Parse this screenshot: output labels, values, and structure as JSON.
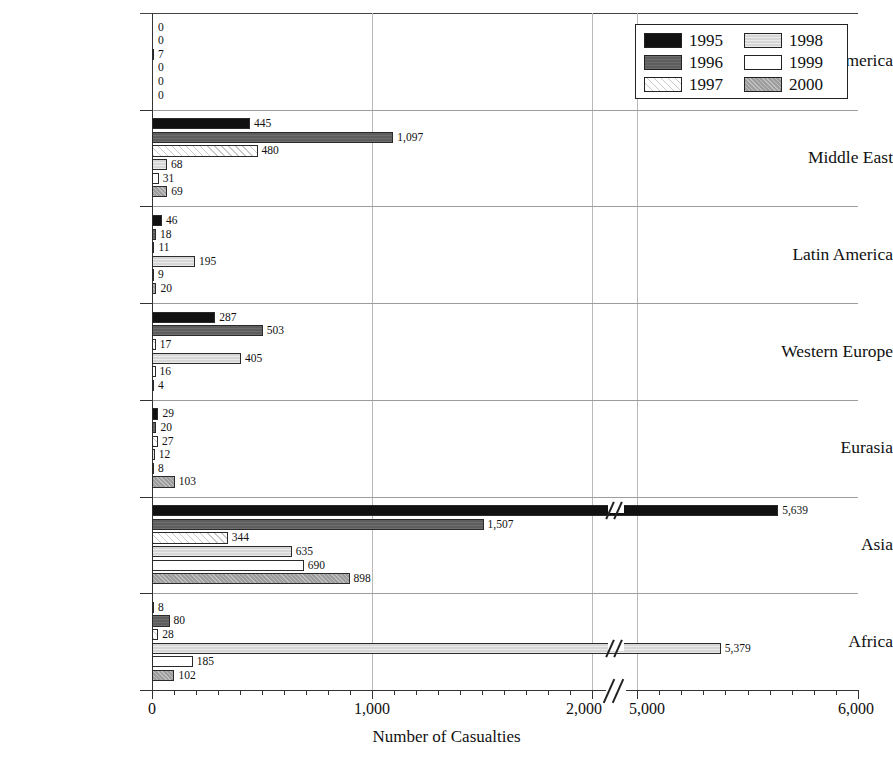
{
  "chart_data": {
    "type": "bar",
    "orientation": "horizontal",
    "title": "",
    "xlabel": "Number of Casualties",
    "ylabel": "",
    "grid": true,
    "legend_position": "top-right",
    "axis_break": {
      "present": true,
      "before": 2000,
      "after": 5000
    },
    "xticks": [
      "0",
      "1,000",
      "2,000",
      "5,000",
      "6,000"
    ],
    "xlim_segment_1": [
      0,
      2000
    ],
    "xlim_segment_2": [
      5000,
      6000
    ],
    "categories": [
      "North America",
      "Middle East",
      "Latin America",
      "Western Europe",
      "Eurasia",
      "Asia",
      "Africa"
    ],
    "series": [
      {
        "name": "1995",
        "color": "#111111",
        "pattern": "solid-black",
        "values": [
          0,
          445,
          46,
          287,
          29,
          5639,
          8
        ],
        "labels": [
          "0",
          "445",
          "46",
          "287",
          "29",
          "5,639",
          "8"
        ]
      },
      {
        "name": "1996",
        "color": "#5e5e5e",
        "pattern": "dark-gray",
        "values": [
          0,
          1097,
          18,
          503,
          20,
          1507,
          80
        ],
        "labels": [
          "0",
          "1,097",
          "18",
          "503",
          "20",
          "1,507",
          "80"
        ]
      },
      {
        "name": "1997",
        "color": "#ffffff",
        "pattern": "diagonal-hatch",
        "values": [
          7,
          480,
          11,
          17,
          27,
          344,
          28
        ],
        "labels": [
          "7",
          "480",
          "11",
          "17",
          "27",
          "344",
          "28"
        ]
      },
      {
        "name": "1998",
        "color": "#d6d6d6",
        "pattern": "light-gray",
        "values": [
          0,
          68,
          195,
          405,
          12,
          635,
          5379
        ],
        "labels": [
          "0",
          "68",
          "195",
          "405",
          "12",
          "635",
          "5,379"
        ]
      },
      {
        "name": "1999",
        "color": "#ffffff",
        "pattern": "white",
        "values": [
          0,
          31,
          9,
          16,
          8,
          690,
          185
        ],
        "labels": [
          "0",
          "31",
          "9",
          "16",
          "8",
          "690",
          "185"
        ]
      },
      {
        "name": "2000",
        "color": "#9d9d9d",
        "pattern": "medium-gray",
        "values": [
          0,
          69,
          20,
          4,
          103,
          898,
          102
        ],
        "labels": [
          "0",
          "69",
          "20",
          "4",
          "103",
          "898",
          "102"
        ]
      }
    ]
  },
  "legend": {
    "items": [
      {
        "label": "1995"
      },
      {
        "label": "1998"
      },
      {
        "label": "1996"
      },
      {
        "label": "1999"
      },
      {
        "label": "1997"
      },
      {
        "label": "2000"
      }
    ]
  }
}
